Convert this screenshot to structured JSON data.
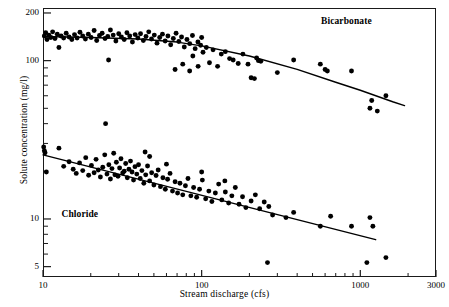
{
  "chart_data": {
    "type": "scatter",
    "title": "",
    "xlabel": "Stream discharge (cfs)",
    "ylabel": "Solute concentration (mg/l)",
    "xscale": "log",
    "yscale": "log",
    "xlim": [
      10,
      3000
    ],
    "ylim": [
      4.3,
      215
    ],
    "grid": false,
    "legend_position": "inline-annotation",
    "xticks_major": [
      10,
      100,
      1000,
      3000
    ],
    "xtick_labels": [
      "10",
      "100",
      "1000",
      "3000"
    ],
    "xticks_minor": [
      20,
      30,
      40,
      50,
      60,
      70,
      80,
      90,
      200,
      300,
      400,
      500,
      600,
      700,
      800,
      900,
      2000
    ],
    "yticks_major": [
      200,
      100,
      10,
      5
    ],
    "ytick_labels": [
      "200",
      "100",
      "10",
      "5"
    ],
    "yticks_minor": [
      90,
      80,
      70,
      60,
      50,
      40,
      30,
      20,
      9,
      8,
      7,
      6
    ],
    "marker": "filled-circle",
    "marker_color": "#000000",
    "line_color": "#000000",
    "series": [
      {
        "name": "Bicarbonate",
        "label_x": 900,
        "label_y": 175,
        "trend_type": "curve-concave-down",
        "trend_points": [
          {
            "x": 10,
            "y": 142
          },
          {
            "x": 20,
            "y": 140
          },
          {
            "x": 40,
            "y": 137
          },
          {
            "x": 70,
            "y": 131
          },
          {
            "x": 100,
            "y": 124
          },
          {
            "x": 200,
            "y": 107
          },
          {
            "x": 400,
            "y": 88
          },
          {
            "x": 700,
            "y": 73
          },
          {
            "x": 1000,
            "y": 65
          },
          {
            "x": 1600,
            "y": 55
          },
          {
            "x": 1900,
            "y": 52
          }
        ],
        "points": [
          {
            "x": 10.2,
            "y": 143
          },
          {
            "x": 10.4,
            "y": 150
          },
          {
            "x": 10.6,
            "y": 136
          },
          {
            "x": 10.9,
            "y": 145
          },
          {
            "x": 11.2,
            "y": 140
          },
          {
            "x": 11.5,
            "y": 152
          },
          {
            "x": 11.9,
            "y": 138
          },
          {
            "x": 12.3,
            "y": 147
          },
          {
            "x": 12.6,
            "y": 121
          },
          {
            "x": 13.0,
            "y": 143
          },
          {
            "x": 13.5,
            "y": 139
          },
          {
            "x": 14.0,
            "y": 149
          },
          {
            "x": 14.6,
            "y": 141
          },
          {
            "x": 15.2,
            "y": 136
          },
          {
            "x": 15.8,
            "y": 146
          },
          {
            "x": 16.4,
            "y": 139
          },
          {
            "x": 17.1,
            "y": 151
          },
          {
            "x": 17.8,
            "y": 143
          },
          {
            "x": 18.5,
            "y": 137
          },
          {
            "x": 19.3,
            "y": 147
          },
          {
            "x": 20.1,
            "y": 140
          },
          {
            "x": 21.0,
            "y": 155
          },
          {
            "x": 21.8,
            "y": 134
          },
          {
            "x": 22.7,
            "y": 144
          },
          {
            "x": 23.6,
            "y": 149
          },
          {
            "x": 24.6,
            "y": 138
          },
          {
            "x": 25.6,
            "y": 142
          },
          {
            "x": 25.9,
            "y": 101
          },
          {
            "x": 26.6,
            "y": 156
          },
          {
            "x": 27.7,
            "y": 145
          },
          {
            "x": 28.8,
            "y": 133
          },
          {
            "x": 30.0,
            "y": 148
          },
          {
            "x": 31.2,
            "y": 141
          },
          {
            "x": 32.5,
            "y": 136
          },
          {
            "x": 33.8,
            "y": 150
          },
          {
            "x": 35.2,
            "y": 143
          },
          {
            "x": 36.6,
            "y": 131
          },
          {
            "x": 38.1,
            "y": 146
          },
          {
            "x": 39.6,
            "y": 139
          },
          {
            "x": 41.2,
            "y": 148
          },
          {
            "x": 42.9,
            "y": 134
          },
          {
            "x": 44.6,
            "y": 142
          },
          {
            "x": 46.4,
            "y": 152
          },
          {
            "x": 48.3,
            "y": 137
          },
          {
            "x": 50.3,
            "y": 145
          },
          {
            "x": 52.3,
            "y": 129
          },
          {
            "x": 54.4,
            "y": 140
          },
          {
            "x": 56.6,
            "y": 147
          },
          {
            "x": 58.9,
            "y": 133
          },
          {
            "x": 61.3,
            "y": 143
          },
          {
            "x": 63.8,
            "y": 126
          },
          {
            "x": 66.3,
            "y": 138
          },
          {
            "x": 69.0,
            "y": 149
          },
          {
            "x": 71.8,
            "y": 132
          },
          {
            "x": 74.7,
            "y": 141
          },
          {
            "x": 77.7,
            "y": 122
          },
          {
            "x": 80.8,
            "y": 136
          },
          {
            "x": 84.1,
            "y": 128
          },
          {
            "x": 87.5,
            "y": 144
          },
          {
            "x": 91.0,
            "y": 119
          },
          {
            "x": 94.7,
            "y": 131
          },
          {
            "x": 98.5,
            "y": 125
          },
          {
            "x": 102,
            "y": 113
          },
          {
            "x": 68,
            "y": 88
          },
          {
            "x": 76,
            "y": 95
          },
          {
            "x": 84,
            "y": 86
          },
          {
            "x": 88,
            "y": 107
          },
          {
            "x": 95,
            "y": 92
          },
          {
            "x": 100,
            "y": 140
          },
          {
            "x": 107,
            "y": 121
          },
          {
            "x": 112,
            "y": 97
          },
          {
            "x": 118,
            "y": 117
          },
          {
            "x": 126,
            "y": 92
          },
          {
            "x": 133,
            "y": 110
          },
          {
            "x": 141,
            "y": 114
          },
          {
            "x": 150,
            "y": 103
          },
          {
            "x": 158,
            "y": 101
          },
          {
            "x": 170,
            "y": 96
          },
          {
            "x": 182,
            "y": 110
          },
          {
            "x": 196,
            "y": 95
          },
          {
            "x": 205,
            "y": 78
          },
          {
            "x": 215,
            "y": 77
          },
          {
            "x": 222,
            "y": 104
          },
          {
            "x": 228,
            "y": 100
          },
          {
            "x": 236,
            "y": 99
          },
          {
            "x": 300,
            "y": 84
          },
          {
            "x": 380,
            "y": 101
          },
          {
            "x": 560,
            "y": 95
          },
          {
            "x": 600,
            "y": 88
          },
          {
            "x": 620,
            "y": 86
          },
          {
            "x": 880,
            "y": 86
          },
          {
            "x": 1150,
            "y": 50
          },
          {
            "x": 1180,
            "y": 56
          },
          {
            "x": 1280,
            "y": 48
          },
          {
            "x": 1450,
            "y": 60
          }
        ]
      },
      {
        "name": "Chloride",
        "label_x": 18,
        "label_y": 10.6,
        "trend_type": "line",
        "trend_points": [
          {
            "x": 10,
            "y": 25.4
          },
          {
            "x": 1250,
            "y": 7.4
          }
        ],
        "points": [
          {
            "x": 10.1,
            "y": 28.5
          },
          {
            "x": 10.2,
            "y": 27.0
          },
          {
            "x": 10.3,
            "y": 26.2
          },
          {
            "x": 10.5,
            "y": 19.8
          },
          {
            "x": 12.6,
            "y": 28.0
          },
          {
            "x": 13.5,
            "y": 21.5
          },
          {
            "x": 14.6,
            "y": 23.0
          },
          {
            "x": 15.5,
            "y": 20.6
          },
          {
            "x": 16.2,
            "y": 19.4
          },
          {
            "x": 17.0,
            "y": 22.6
          },
          {
            "x": 17.8,
            "y": 20.2
          },
          {
            "x": 18.6,
            "y": 24.4
          },
          {
            "x": 19.4,
            "y": 18.9
          },
          {
            "x": 20.2,
            "y": 21.8
          },
          {
            "x": 21.0,
            "y": 19.6
          },
          {
            "x": 21.6,
            "y": 23.8
          },
          {
            "x": 22.3,
            "y": 20.4
          },
          {
            "x": 23.0,
            "y": 18.4
          },
          {
            "x": 23.8,
            "y": 21.2
          },
          {
            "x": 24.5,
            "y": 25.4
          },
          {
            "x": 24.8,
            "y": 40.0
          },
          {
            "x": 25.3,
            "y": 19.2
          },
          {
            "x": 26.0,
            "y": 22.0
          },
          {
            "x": 26.6,
            "y": 17.9
          },
          {
            "x": 27.2,
            "y": 20.8
          },
          {
            "x": 27.9,
            "y": 26.0
          },
          {
            "x": 28.4,
            "y": 19.0
          },
          {
            "x": 29.0,
            "y": 22.8
          },
          {
            "x": 29.7,
            "y": 18.6
          },
          {
            "x": 30.4,
            "y": 21.0
          },
          {
            "x": 31.0,
            "y": 24.0
          },
          {
            "x": 31.8,
            "y": 19.5
          },
          {
            "x": 32.5,
            "y": 20.0
          },
          {
            "x": 33.2,
            "y": 22.4
          },
          {
            "x": 34.0,
            "y": 18.2
          },
          {
            "x": 34.8,
            "y": 20.6
          },
          {
            "x": 35.6,
            "y": 23.2
          },
          {
            "x": 36.4,
            "y": 19.8
          },
          {
            "x": 37.2,
            "y": 17.6
          },
          {
            "x": 38.0,
            "y": 21.4
          },
          {
            "x": 39.0,
            "y": 19.2
          },
          {
            "x": 40.0,
            "y": 22.0
          },
          {
            "x": 41.0,
            "y": 18.0
          },
          {
            "x": 42.0,
            "y": 20.2
          },
          {
            "x": 43.2,
            "y": 16.8
          },
          {
            "x": 44.4,
            "y": 19.0
          },
          {
            "x": 45.6,
            "y": 21.6
          },
          {
            "x": 47.0,
            "y": 17.4
          },
          {
            "x": 48.4,
            "y": 19.6
          },
          {
            "x": 50.0,
            "y": 16.4
          },
          {
            "x": 51.6,
            "y": 18.8
          },
          {
            "x": 53.2,
            "y": 20.4
          },
          {
            "x": 55.0,
            "y": 16.0
          },
          {
            "x": 57.0,
            "y": 18.2
          },
          {
            "x": 59.0,
            "y": 15.4
          },
          {
            "x": 61.0,
            "y": 17.8
          },
          {
            "x": 63.2,
            "y": 19.4
          },
          {
            "x": 65.5,
            "y": 15.0
          },
          {
            "x": 68.0,
            "y": 17.2
          },
          {
            "x": 70.5,
            "y": 14.6
          },
          {
            "x": 73.0,
            "y": 16.8
          },
          {
            "x": 76.0,
            "y": 14.2
          },
          {
            "x": 79.0,
            "y": 16.2
          },
          {
            "x": 82.0,
            "y": 18.0
          },
          {
            "x": 85.5,
            "y": 14.0
          },
          {
            "x": 89.0,
            "y": 15.8
          },
          {
            "x": 93.0,
            "y": 13.7
          },
          {
            "x": 97.0,
            "y": 15.4
          },
          {
            "x": 101,
            "y": 17.6
          },
          {
            "x": 106,
            "y": 13.4
          },
          {
            "x": 111,
            "y": 15.0
          },
          {
            "x": 116,
            "y": 12.9
          },
          {
            "x": 122,
            "y": 14.6
          },
          {
            "x": 128,
            "y": 16.6
          },
          {
            "x": 134,
            "y": 13.2
          },
          {
            "x": 141,
            "y": 14.8
          },
          {
            "x": 148,
            "y": 12.6
          },
          {
            "x": 155,
            "y": 14.0
          },
          {
            "x": 163,
            "y": 15.8
          },
          {
            "x": 172,
            "y": 12.4
          },
          {
            "x": 181,
            "y": 13.8
          },
          {
            "x": 190,
            "y": 11.8
          },
          {
            "x": 205,
            "y": 13.0
          },
          {
            "x": 218,
            "y": 14.2
          },
          {
            "x": 232,
            "y": 11.6
          },
          {
            "x": 248,
            "y": 12.8
          },
          {
            "x": 265,
            "y": 12.0
          },
          {
            "x": 44,
            "y": 26.5
          },
          {
            "x": 47,
            "y": 24.8
          },
          {
            "x": 60,
            "y": 22.2
          },
          {
            "x": 100,
            "y": 19.8
          },
          {
            "x": 140,
            "y": 17.4
          },
          {
            "x": 280,
            "y": 10.6
          },
          {
            "x": 260,
            "y": 5.3
          },
          {
            "x": 340,
            "y": 10.2
          },
          {
            "x": 380,
            "y": 11.0
          },
          {
            "x": 560,
            "y": 9.0
          },
          {
            "x": 650,
            "y": 10.4
          },
          {
            "x": 880,
            "y": 9.0
          },
          {
            "x": 1100,
            "y": 5.3
          },
          {
            "x": 1150,
            "y": 10.2
          },
          {
            "x": 1200,
            "y": 9.0
          },
          {
            "x": 1450,
            "y": 5.7
          }
        ]
      }
    ]
  },
  "axis": {
    "xlabel": "Stream discharge (cfs)",
    "ylabel": "Solute concentration (mg/l)"
  },
  "labels": {
    "bicarbonate": "Bicarbonate",
    "chloride": "Chloride"
  }
}
